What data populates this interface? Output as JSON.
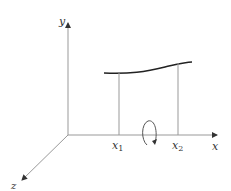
{
  "diagram": {
    "axes": {
      "x_label": "x",
      "y_label": "y",
      "z_label": "z"
    },
    "markers": [
      {
        "label": "x",
        "sub": "1"
      },
      {
        "label": "x",
        "sub": "2"
      }
    ],
    "curve": {
      "description": "curve y=f(x) over [x1, x2]"
    },
    "rotation": {
      "description": "rotation arrow about x-axis"
    },
    "colors": {
      "axis": "#999999",
      "curve": "#222222",
      "text": "#333333"
    }
  }
}
